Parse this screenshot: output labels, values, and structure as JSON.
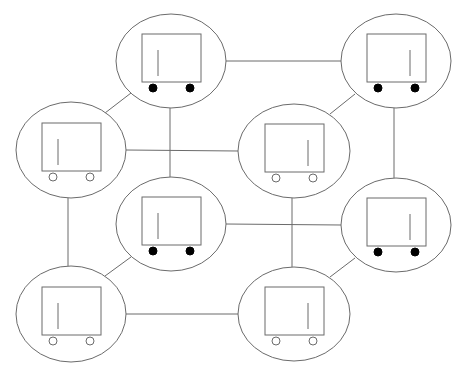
{
  "diagram": {
    "type": "graph",
    "colors": {
      "stroke": "#6b6b6b",
      "background": "#ffffff",
      "wheel_filled": "#000000",
      "wheel_hollow": "#ffffff"
    },
    "nodes": [
      {
        "id": "A",
        "cx": 171,
        "cy": 61,
        "rx": 55,
        "ry": 47,
        "wheels": "filled",
        "line_side": "left",
        "layer": "back"
      },
      {
        "id": "B",
        "cx": 396,
        "cy": 61,
        "rx": 55,
        "ry": 47,
        "wheels": "filled",
        "line_side": "right",
        "layer": "back"
      },
      {
        "id": "C",
        "cx": 71,
        "cy": 150,
        "rx": 55,
        "ry": 48,
        "wheels": "hollow",
        "line_side": "left",
        "layer": "front"
      },
      {
        "id": "D",
        "cx": 294,
        "cy": 151,
        "rx": 56,
        "ry": 47,
        "wheels": "hollow",
        "line_side": "right",
        "layer": "front"
      },
      {
        "id": "E",
        "cx": 171,
        "cy": 224,
        "rx": 55,
        "ry": 47,
        "wheels": "filled",
        "line_side": "left",
        "layer": "back"
      },
      {
        "id": "F",
        "cx": 396,
        "cy": 225,
        "rx": 55,
        "ry": 47,
        "wheels": "filled",
        "line_side": "right",
        "layer": "back"
      },
      {
        "id": "G",
        "cx": 71,
        "cy": 314,
        "rx": 55,
        "ry": 48,
        "wheels": "hollow",
        "line_side": "left",
        "layer": "front"
      },
      {
        "id": "H",
        "cx": 294,
        "cy": 314,
        "rx": 56,
        "ry": 47,
        "wheels": "hollow",
        "line_side": "right",
        "layer": "front"
      }
    ],
    "edges": [
      {
        "from": "A",
        "to": "B",
        "x1": 226,
        "y1": 61,
        "x2": 341,
        "y2": 61
      },
      {
        "from": "A",
        "to": "C",
        "x1": 131,
        "y1": 93,
        "x2": 105,
        "y2": 113
      },
      {
        "from": "A",
        "to": "E",
        "x1": 170,
        "y1": 108,
        "x2": 170,
        "y2": 177
      },
      {
        "from": "B",
        "to": "D",
        "x1": 355,
        "y1": 94,
        "x2": 330,
        "y2": 114
      },
      {
        "from": "B",
        "to": "F",
        "x1": 394,
        "y1": 108,
        "x2": 394,
        "y2": 178
      },
      {
        "from": "C",
        "to": "D",
        "x1": 126,
        "y1": 150,
        "x2": 238,
        "y2": 151
      },
      {
        "from": "C",
        "to": "G",
        "x1": 68,
        "y1": 198,
        "x2": 68,
        "y2": 266
      },
      {
        "from": "D",
        "to": "H",
        "x1": 292,
        "y1": 198,
        "x2": 292,
        "y2": 267
      },
      {
        "from": "E",
        "to": "F",
        "x1": 226,
        "y1": 224,
        "x2": 341,
        "y2": 225
      },
      {
        "from": "E",
        "to": "G",
        "x1": 131,
        "y1": 257,
        "x2": 105,
        "y2": 276
      },
      {
        "from": "F",
        "to": "H",
        "x1": 355,
        "y1": 258,
        "x2": 330,
        "y2": 277
      },
      {
        "from": "G",
        "to": "H",
        "x1": 126,
        "y1": 314,
        "x2": 238,
        "y2": 314
      }
    ]
  }
}
